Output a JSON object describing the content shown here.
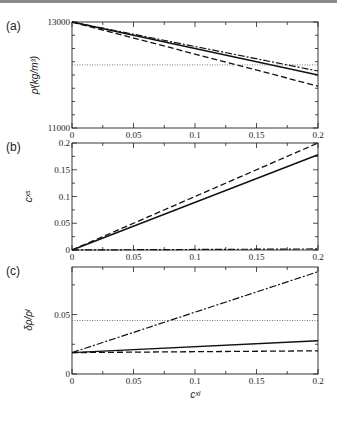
{
  "figure": {
    "panels": [
      {
        "label": "(a)",
        "ylabel": "ρˡ(kg/m³)",
        "yticks": [
          "11000",
          "13000"
        ]
      },
      {
        "label": "(b)",
        "ylabel": "cˣˢ",
        "yticks": [
          "0",
          "0.05",
          "0.1",
          "0.15",
          "0.2"
        ]
      },
      {
        "label": "(c)",
        "ylabel": "δρ/ρˡ",
        "yticks": [
          "0",
          "0.05"
        ]
      }
    ],
    "xticks": [
      "0",
      "0.05",
      "0.1",
      "0.15",
      "0.2"
    ],
    "xlabel": "cˣˡ"
  },
  "chart_data": [
    {
      "type": "line",
      "title": "(a)",
      "xlabel": "c_x^l",
      "ylabel": "ρ^l (kg/m^3)",
      "xlim": [
        0,
        0.2
      ],
      "ylim": [
        11000,
        13000
      ],
      "x": [
        0,
        0.2
      ],
      "series": [
        {
          "name": "solid",
          "style": "solid",
          "values": [
            13000,
            12000
          ]
        },
        {
          "name": "dashed",
          "style": "dashed",
          "values": [
            13000,
            11790
          ]
        },
        {
          "name": "dash-dot",
          "style": "dashdot",
          "values": [
            13000,
            12075
          ]
        },
        {
          "name": "dotted",
          "style": "dotted",
          "values": [
            12190,
            12190
          ]
        }
      ]
    },
    {
      "type": "line",
      "title": "(b)",
      "xlabel": "c_x^l",
      "ylabel": "c_x^s",
      "xlim": [
        0,
        0.2
      ],
      "ylim": [
        0,
        0.2
      ],
      "x": [
        0,
        0.2
      ],
      "series": [
        {
          "name": "solid",
          "style": "solid",
          "values": [
            0,
            0.178
          ]
        },
        {
          "name": "dashed",
          "style": "dashed",
          "values": [
            0,
            0.2
          ]
        },
        {
          "name": "dash-dot",
          "style": "dashdot",
          "values": [
            0,
            0.002
          ]
        }
      ]
    },
    {
      "type": "line",
      "title": "(c)",
      "xlabel": "c_x^l",
      "ylabel": "δρ/ρ^l",
      "xlim": [
        0,
        0.2
      ],
      "ylim": [
        0,
        0.09
      ],
      "x": [
        0,
        0.2
      ],
      "series": [
        {
          "name": "solid",
          "style": "solid",
          "values": [
            0.018,
            0.028
          ]
        },
        {
          "name": "dashed",
          "style": "dashed",
          "values": [
            0.018,
            0.0195
          ]
        },
        {
          "name": "dash-dot",
          "style": "dashdot",
          "values": [
            0.018,
            0.086
          ]
        },
        {
          "name": "dotted",
          "style": "dotted",
          "values": [
            0.045,
            0.045
          ]
        }
      ]
    }
  ]
}
